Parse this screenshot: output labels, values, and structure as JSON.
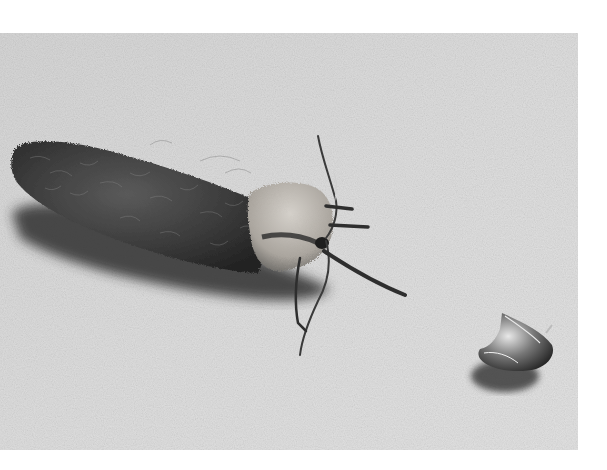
{
  "image": {
    "kind": "black-and-white photograph",
    "subject": "hairy moth resting on textured surface",
    "secondary_object": "small shiny shell-like fragment",
    "colors": {
      "page_background": "#ffffff",
      "surface": "#dcdcdc",
      "surface_dark": "#c8c8c8",
      "moth_body": "#3a3a3a",
      "moth_thorax": "#b8b4ae",
      "shadow": "#2a2a2a"
    }
  }
}
